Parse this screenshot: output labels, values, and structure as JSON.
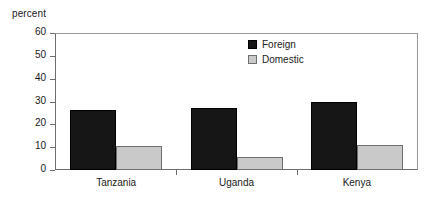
{
  "chart_data": {
    "type": "bar",
    "title": "",
    "subtitle": "",
    "xlabel": "",
    "ylabel": "percent",
    "categories": [
      "Tanzania",
      "Uganda",
      "Kenya"
    ],
    "series": [
      {
        "name": "Foreign",
        "color": "#161616",
        "values": [
          26.5,
          27.0,
          30.0
        ]
      },
      {
        "name": "Domestic",
        "color": "#c9c9c9",
        "values": [
          10.5,
          5.5,
          11.0
        ]
      }
    ],
    "ylim": [
      0,
      60
    ],
    "yticks": [
      0,
      10,
      20,
      30,
      40,
      50,
      60
    ],
    "ytick_labels": [
      "0",
      "10",
      "20",
      "30",
      "40",
      "50",
      "60"
    ],
    "grid": false,
    "legend_position": "upper-center"
  },
  "legend": {
    "items": [
      {
        "label": "Foreign",
        "swatch": "legend-swatch-foreign"
      },
      {
        "label": "Domestic",
        "swatch": "legend-swatch-domestic"
      }
    ]
  }
}
